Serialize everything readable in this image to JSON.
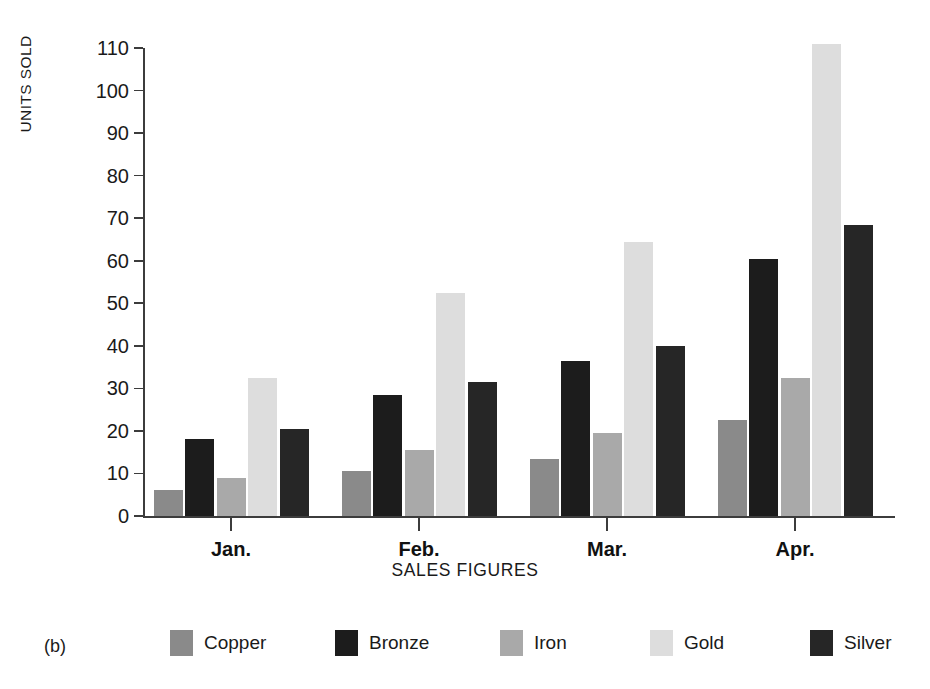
{
  "panel": {
    "label": "(b)"
  },
  "chart_data": {
    "type": "bar",
    "title": "",
    "xlabel": "SALES FIGURES",
    "ylabel": "UNITS SOLD",
    "categories": [
      "Jan.",
      "Feb.",
      "Mar.",
      "Apr."
    ],
    "ylim": [
      0,
      110
    ],
    "yticks": [
      0,
      10,
      20,
      30,
      40,
      50,
      60,
      70,
      80,
      90,
      100,
      110
    ],
    "ytick_labels": [
      "0",
      "10",
      "20",
      "30",
      "40",
      "50",
      "60",
      "70",
      "80",
      "90",
      "100",
      "110"
    ],
    "grid": false,
    "legend_position": "bottom",
    "series": [
      {
        "name": "Copper",
        "color": "#8a8a8a",
        "values": [
          6,
          10.5,
          13.5,
          22.5
        ]
      },
      {
        "name": "Bronze",
        "color": "#1c1c1c",
        "values": [
          18,
          28.5,
          36.5,
          60.5
        ]
      },
      {
        "name": "Iron",
        "color": "#a9a9a9",
        "values": [
          9,
          15.5,
          19.5,
          32.5
        ]
      },
      {
        "name": "Gold",
        "color": "#dddddd",
        "values": [
          32.5,
          52.5,
          64.5,
          111
        ]
      },
      {
        "name": "Silver",
        "color": "#262626",
        "values": [
          20.5,
          31.5,
          40,
          68.5
        ]
      }
    ]
  }
}
